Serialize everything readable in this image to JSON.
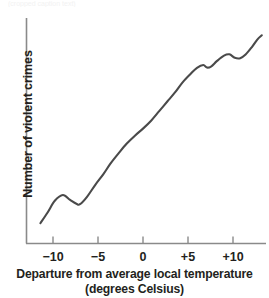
{
  "figure": {
    "top_cropped_caption": "(cropped caption text)",
    "axis_color": "#8a8a8a",
    "curve_color": "#4a4a4a",
    "background_color": "#ffffff"
  },
  "chart_data": {
    "type": "line",
    "title": "",
    "subtitle": "",
    "xlabel_line1": "Departure from average local temperature",
    "xlabel_line2": "(degrees Celsius)",
    "ylabel": "Number of violent crimes",
    "grid": false,
    "legend": "none",
    "xlim": [
      -12.9,
      13.6
    ],
    "ylim": [
      0,
      100
    ],
    "xticks": [
      -10,
      -5,
      0,
      5,
      10
    ],
    "xtick_labels": [
      "−10",
      "−5",
      "0",
      "+5",
      "+10"
    ],
    "yticks": [],
    "ytick_labels": [],
    "series": [
      {
        "name": "Violent crimes vs temperature departure",
        "x": [
          -11.4,
          -10.6,
          -9.8,
          -8.9,
          -8.1,
          -7.4,
          -7.0,
          -6.2,
          -5.3,
          -4.4,
          -3.6,
          -2.7,
          -1.8,
          -0.9,
          0.0,
          0.9,
          1.8,
          2.7,
          3.6,
          4.4,
          5.3,
          6.0,
          6.7,
          7.1,
          7.6,
          8.2,
          9.0,
          9.6,
          10.2,
          10.8,
          11.4,
          12.1,
          12.7,
          13.2
        ],
        "y": [
          9.5,
          14.5,
          20.0,
          22.7,
          20.4,
          18.6,
          18.4,
          22.0,
          27.5,
          32.5,
          37.5,
          42.3,
          46.8,
          50.5,
          53.8,
          57.5,
          62.0,
          66.5,
          71.0,
          75.5,
          79.5,
          82.3,
          83.6,
          82.4,
          83.0,
          85.4,
          88.0,
          88.6,
          87.0,
          86.8,
          88.5,
          92.0,
          95.5,
          97.5
        ]
      }
    ],
    "annotations": []
  }
}
